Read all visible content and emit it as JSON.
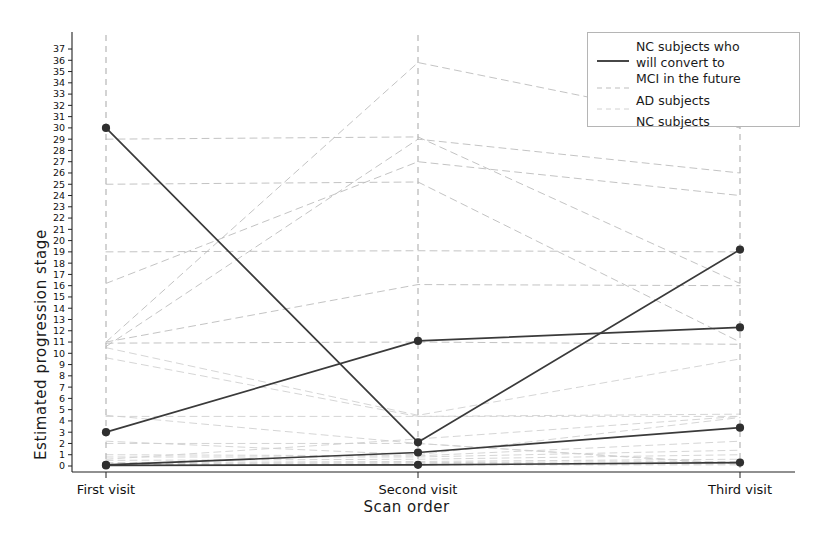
{
  "chart_data": {
    "type": "line",
    "title": "",
    "xlabel": "Scan order",
    "ylabel": "Estimated progression stage",
    "categories": [
      "First visit",
      "Second visit",
      "Third visit"
    ],
    "x": [
      0,
      1,
      2
    ],
    "ylim": [
      0,
      37.8
    ],
    "xlim": [
      -0.18,
      2.18
    ],
    "yticks": [
      0,
      1,
      2,
      3,
      4,
      5,
      6,
      7,
      8,
      9,
      10,
      11,
      12,
      13,
      14,
      15,
      16,
      17,
      18,
      19,
      20,
      21,
      22,
      23,
      24,
      25,
      26,
      27,
      28,
      29,
      30,
      31,
      32,
      33,
      34,
      35,
      36,
      37
    ],
    "grid": false,
    "vertical_guides": [
      "First visit",
      "Second visit",
      "Third visit"
    ],
    "legend": {
      "position": "upper right",
      "entries": [
        {
          "label": "NC subjects who will convert to MCI in the future",
          "style": "solid",
          "color": "#333333",
          "width": 1.6
        },
        {
          "label": "AD subjects",
          "style": "dashed",
          "color": "#b9b9b9",
          "width": 0.8
        },
        {
          "label": "NC subjects",
          "style": "dashed",
          "color": "#cfcfcf",
          "width": 0.8
        }
      ]
    },
    "series": [
      {
        "name": "converter-1",
        "group": "NC subjects who will convert to MCI in the future",
        "style": "solid",
        "marker": true,
        "values": [
          30.0,
          2.1,
          19.2
        ]
      },
      {
        "name": "converter-2",
        "group": "NC subjects who will convert to MCI in the future",
        "style": "solid",
        "marker": true,
        "values": [
          3.0,
          11.1,
          12.3
        ]
      },
      {
        "name": "converter-3",
        "group": "NC subjects who will convert to MCI in the future",
        "style": "solid",
        "marker": true,
        "values": [
          0.1,
          1.2,
          3.4
        ]
      },
      {
        "name": "converter-4",
        "group": "NC subjects who will convert to MCI in the future",
        "style": "solid",
        "marker": true,
        "values": [
          0.05,
          0.1,
          0.3
        ]
      },
      {
        "name": "ad-1",
        "group": "AD subjects",
        "style": "dashed",
        "marker": false,
        "values": [
          29.0,
          29.2,
          16.2
        ]
      },
      {
        "name": "ad-2",
        "group": "AD subjects",
        "style": "dashed",
        "marker": false,
        "values": [
          25.0,
          25.2,
          11.0
        ]
      },
      {
        "name": "ad-3",
        "group": "AD subjects",
        "style": "dashed",
        "marker": false,
        "values": [
          19.0,
          19.1,
          19.0
        ]
      },
      {
        "name": "ad-4",
        "group": "AD subjects",
        "style": "dashed",
        "marker": false,
        "values": [
          16.2,
          27.0,
          24.0
        ]
      },
      {
        "name": "ad-5",
        "group": "AD subjects",
        "style": "dashed",
        "marker": false,
        "values": [
          11.0,
          35.8,
          30.0
        ]
      },
      {
        "name": "ad-6",
        "group": "AD subjects",
        "style": "dashed",
        "marker": false,
        "values": [
          10.6,
          29.0,
          26.0
        ]
      },
      {
        "name": "ad-7",
        "group": "AD subjects",
        "style": "dashed",
        "marker": false,
        "values": [
          11.0,
          16.1,
          16.0
        ]
      },
      {
        "name": "ad-8",
        "group": "AD subjects",
        "style": "dashed",
        "marker": false,
        "values": [
          10.9,
          11.0,
          10.8
        ]
      },
      {
        "name": "nc-1",
        "group": "NC subjects",
        "style": "dashed",
        "marker": false,
        "values": [
          10.5,
          4.5,
          9.5
        ]
      },
      {
        "name": "nc-2",
        "group": "NC subjects",
        "style": "dashed",
        "marker": false,
        "values": [
          9.6,
          4.4,
          4.6
        ]
      },
      {
        "name": "nc-3",
        "group": "NC subjects",
        "style": "dashed",
        "marker": false,
        "values": [
          4.4,
          4.4,
          4.4
        ]
      },
      {
        "name": "nc-4",
        "group": "NC subjects",
        "style": "dashed",
        "marker": false,
        "values": [
          2.2,
          1.0,
          4.3
        ]
      },
      {
        "name": "nc-5",
        "group": "NC subjects",
        "style": "dashed",
        "marker": false,
        "values": [
          1.0,
          0.9,
          2.2
        ]
      },
      {
        "name": "nc-6",
        "group": "NC subjects",
        "style": "dashed",
        "marker": false,
        "values": [
          0.8,
          0.8,
          1.4
        ]
      },
      {
        "name": "nc-7",
        "group": "NC subjects",
        "style": "dashed",
        "marker": false,
        "values": [
          0.5,
          0.6,
          1.0
        ]
      },
      {
        "name": "nc-8",
        "group": "NC subjects",
        "style": "dashed",
        "marker": false,
        "values": [
          0.3,
          0.4,
          0.6
        ]
      },
      {
        "name": "nc-9",
        "group": "NC subjects",
        "style": "dashed",
        "marker": false,
        "values": [
          0.2,
          0.3,
          0.4
        ]
      },
      {
        "name": "nc-10",
        "group": "NC subjects",
        "style": "dashed",
        "marker": false,
        "values": [
          0.1,
          0.2,
          0.2
        ]
      },
      {
        "name": "nc-11",
        "group": "NC subjects",
        "style": "dashed",
        "marker": false,
        "values": [
          0.05,
          0.1,
          0.1
        ]
      },
      {
        "name": "nc-12",
        "group": "NC subjects",
        "style": "dashed",
        "marker": false,
        "values": [
          2.0,
          2.0,
          0.2
        ]
      },
      {
        "name": "nc-13",
        "group": "NC subjects",
        "style": "dashed",
        "marker": false,
        "values": [
          4.5,
          2.0,
          0.15
        ]
      },
      {
        "name": "nc-14",
        "group": "NC subjects",
        "style": "dashed",
        "marker": false,
        "values": [
          0.6,
          2.4,
          4.4
        ]
      }
    ]
  },
  "legend": {
    "line1_a": "NC subjects who",
    "line1_b": "will convert to",
    "line1_c": "MCI in the future",
    "line2": "AD subjects",
    "line3": "NC subjects"
  },
  "axes": {
    "ylabel": "Estimated progression stage",
    "xlabel": "Scan order",
    "xticks": [
      "First visit",
      "Second visit",
      "Third visit"
    ]
  }
}
